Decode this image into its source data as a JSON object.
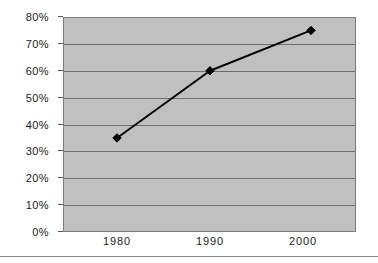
{
  "chart_data": {
    "type": "line",
    "title": "",
    "subtitle": "",
    "xlabel": "",
    "ylabel": "",
    "x": [
      1980,
      1990,
      2000
    ],
    "categories": [
      "1980",
      "1990",
      "2000"
    ],
    "values": [
      35,
      60,
      75
    ],
    "series": [
      {
        "name": "",
        "values": [
          35,
          60,
          75
        ],
        "marker": "diamond",
        "marker_color": "#000000",
        "line_color": "#000000"
      }
    ],
    "ylim": [
      0,
      80
    ],
    "y_tick_step": 10,
    "y_tick_labels": [
      "0%",
      "10%",
      "20%",
      "30%",
      "40%",
      "50%",
      "60%",
      "70%",
      "80%"
    ],
    "y_tick_values": [
      0,
      10,
      20,
      30,
      40,
      50,
      60,
      70,
      80
    ],
    "x_tick_labels": [
      "1980",
      "1990",
      "2000"
    ],
    "x_tick_positions_px": [
      117,
      210,
      303
    ],
    "point_positions_px": [
      117,
      210,
      311
    ],
    "grid": true,
    "grid_axis": "y",
    "legend": false,
    "legend_position": "none",
    "annotations": [],
    "plot_background_color": "#c0c0c0",
    "gridline_color": "#6e6e6e",
    "page_background_color": "#ffffff",
    "border_color": "#7c7c7c"
  },
  "figure": {
    "separator_color": "#8a8a8a"
  }
}
